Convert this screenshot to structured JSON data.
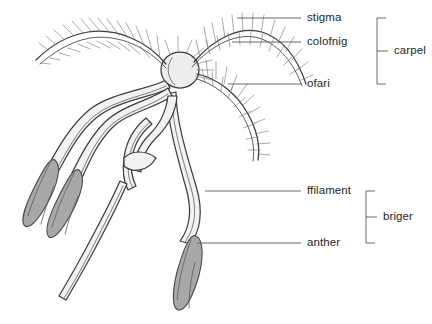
{
  "diagram": {
    "background_color": "#ffffff",
    "ink_color": "#3a3a3a",
    "text_color": "#262626",
    "anther_fill": "#a8a8a8",
    "ovary_fill": "#ededed",
    "filament_fill": "#f2f2f2",
    "leader_color": "#5a5a5a"
  },
  "labels": [
    {
      "id": "stigma",
      "text": "stigma",
      "x": 307,
      "y": 12,
      "leader_x1": 237,
      "leader_x2": 301,
      "leader_y": 18
    },
    {
      "id": "colofnig",
      "text": "colofnig",
      "x": 307,
      "y": 36,
      "leader_x1": 232,
      "leader_x2": 301,
      "leader_y": 42
    },
    {
      "id": "ofari",
      "text": "ofari",
      "x": 307,
      "y": 78,
      "leader_x1": 228,
      "leader_x2": 301,
      "leader_y": 84
    },
    {
      "id": "ffilament",
      "text": "ffilament",
      "x": 307,
      "y": 185,
      "leader_x1": 205,
      "leader_x2": 301,
      "leader_y": 191
    },
    {
      "id": "anther",
      "text": "anther",
      "x": 307,
      "y": 237,
      "leader_x1": 197,
      "leader_x2": 301,
      "leader_y": 243
    }
  ],
  "brackets": [
    {
      "id": "carpel",
      "text": "carpel",
      "label_x": 394,
      "label_y": 45,
      "x": 377,
      "y_top": 18,
      "y_bottom": 84,
      "tick_x": 388,
      "tick_y": 51
    },
    {
      "id": "briger",
      "text": "briger",
      "label_x": 383,
      "label_y": 211,
      "x": 366,
      "y_top": 191,
      "y_bottom": 243,
      "tick_x": 377,
      "tick_y": 217
    }
  ],
  "parts": [
    {
      "id": "ovary",
      "name": "ovary-bulb",
      "shape": "ellipse",
      "cx": 180,
      "cy": 70,
      "rx": 19,
      "ry": 18
    },
    {
      "id": "stigma-left",
      "name": "stigma-arm-left",
      "shape": "plumose-arm"
    },
    {
      "id": "stigma-right",
      "name": "stigma-arm-right",
      "shape": "plumose-arm"
    },
    {
      "id": "stigma-lower",
      "name": "stigma-arm-lower",
      "shape": "plumose-arm"
    },
    {
      "id": "anther-1",
      "name": "anther-left-outer",
      "shape": "lobe",
      "cx": 41,
      "cy": 188,
      "angle": -34
    },
    {
      "id": "anther-2",
      "name": "anther-left-inner",
      "shape": "lobe",
      "cx": 63,
      "cy": 197,
      "angle": -30
    },
    {
      "id": "anther-3",
      "name": "anther-lower",
      "shape": "lobe",
      "cx": 186,
      "cy": 255,
      "angle": -14
    },
    {
      "id": "filament-1",
      "name": "filament-left-outer"
    },
    {
      "id": "filament-2",
      "name": "filament-left-inner"
    },
    {
      "id": "filament-3",
      "name": "filament-lower"
    },
    {
      "id": "lodicule",
      "name": "lodicule-pair"
    },
    {
      "id": "pedicel",
      "name": "pedicel-stalk"
    }
  ]
}
